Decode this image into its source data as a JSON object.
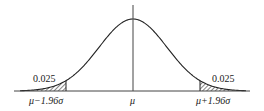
{
  "diagram": {
    "type": "normal-distribution",
    "center_label": "μ",
    "left_cutoff_label": "μ−1.96σ",
    "right_cutoff_label": "μ+1.96σ",
    "left_tail_area": "0.025",
    "right_tail_area": "0.025",
    "colors": {
      "line": "#222222",
      "hatch": "#333333",
      "background": "#ffffff"
    }
  }
}
